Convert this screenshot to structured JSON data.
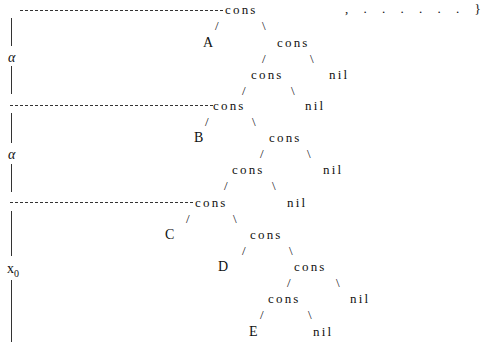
{
  "diagram": {
    "type": "list-structure-tree",
    "top_right": ", . . . . . . }",
    "left_labels": [
      {
        "text": "α",
        "row": "first"
      },
      {
        "text": "α",
        "row": "second"
      },
      {
        "text": "x",
        "subscript": "0",
        "row": "third"
      }
    ],
    "nodes": {
      "cons": "cons",
      "nil": "nil",
      "slash": "/",
      "backslash": "\\"
    },
    "leaves": [
      "A",
      "B",
      "C",
      "D",
      "E"
    ],
    "segments": [
      {
        "name": "segment-1",
        "root": "cons",
        "left_leaf": "A",
        "structure": "cons(A, cons(cons(..., nil), nil))"
      },
      {
        "name": "segment-2",
        "root": "cons",
        "left_leaf": "B",
        "structure": "cons(B, cons(cons(..., nil), nil))"
      },
      {
        "name": "segment-3",
        "root": "cons",
        "left_leaf": "C",
        "structure": "cons(C, cons(D, cons(cons(E, nil), nil)))"
      }
    ]
  }
}
